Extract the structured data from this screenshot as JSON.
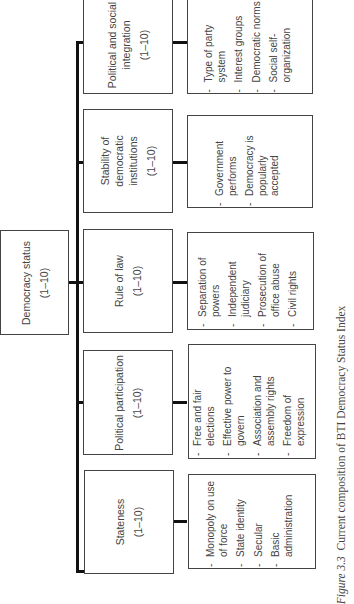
{
  "root": {
    "title": "Democracy status",
    "range": "(1–10)"
  },
  "criteria": [
    {
      "title": "Political and social integration",
      "range": "(1–10)",
      "indicators": [
        "Type of party system",
        "Interest groups",
        "Democratic norms",
        "Social self-organization"
      ]
    },
    {
      "title": "Stability of democratic institutions",
      "range": "(1–10)",
      "indicators": [
        "Government performs",
        "Democracy is popularly accepted"
      ]
    },
    {
      "title": "Rule of law",
      "range": "(1–10)",
      "indicators": [
        "Separation of powers",
        "Independent judiciary",
        "Prosecution of office abuse",
        "Civil rights"
      ]
    },
    {
      "title": "Political participation",
      "range": "(1–10)",
      "indicators": [
        "Free and fair elections",
        "Effective power to govern",
        "Association and assembly rights",
        "Freedom of expression"
      ]
    },
    {
      "title": "Stateness",
      "range": "(1–10)",
      "indicators": [
        "Monopoly on use of force",
        "State identity",
        "Secular",
        "Basic administration"
      ]
    }
  ],
  "caption": {
    "label": "Figure 3.3",
    "text": "Current composition of BTI Democracy Status Index"
  }
}
